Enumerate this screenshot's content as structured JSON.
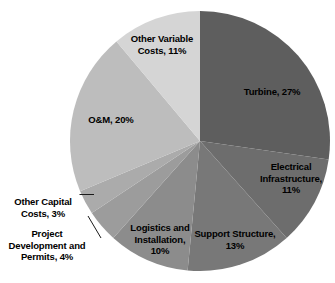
{
  "chart_data": {
    "type": "pie",
    "title": "",
    "unit": "%",
    "legend": "none",
    "start_angle_deg": 0,
    "direction": "clockwise",
    "categories": [
      "Turbine",
      "Electrical Infrastructure",
      "Support Structure",
      "Logistics and Installation",
      "Project Development and Permits",
      "Other Capital Costs",
      "O&M",
      "Other Variable Costs"
    ],
    "values": [
      27,
      11,
      13,
      10,
      4,
      3,
      20,
      11
    ],
    "colors": [
      "#5e5e5e",
      "#6d6d6d",
      "#787878",
      "#8c8c8c",
      "#9c9c9c",
      "#ababab",
      "#bdbdbd",
      "#d5d5d5"
    ],
    "slices": [
      {
        "name": "Turbine",
        "value": 27,
        "color": "#5e5e5e",
        "label": "Turbine, 27%",
        "label_placement": "inside"
      },
      {
        "name": "Electrical Infrastructure",
        "value": 11,
        "color": "#6d6d6d",
        "label": "Electrical\nInfrastructure,\n11%",
        "label_placement": "inside"
      },
      {
        "name": "Support Structure",
        "value": 13,
        "color": "#787878",
        "label": "Support Structure,\n13%",
        "label_placement": "inside"
      },
      {
        "name": "Logistics and Installation",
        "value": 10,
        "color": "#8c8c8c",
        "label": "Logistics and\nInstallation,\n10%",
        "label_placement": "inside"
      },
      {
        "name": "Project Development and Permits",
        "value": 4,
        "color": "#9c9c9c",
        "label": "Project\nDevelopment and\nPermits, 4%",
        "label_placement": "outside-left"
      },
      {
        "name": "Other Capital Costs",
        "value": 3,
        "color": "#ababab",
        "label": "Other Capital\nCosts, 3%",
        "label_placement": "outside-left"
      },
      {
        "name": "O&M",
        "value": 20,
        "color": "#bdbdbd",
        "label": "O&M, 20%",
        "label_placement": "inside"
      },
      {
        "name": "Other Variable Costs",
        "value": 11,
        "color": "#d5d5d5",
        "label": "Other Variable\nCosts, 11%",
        "label_placement": "inside"
      }
    ]
  }
}
